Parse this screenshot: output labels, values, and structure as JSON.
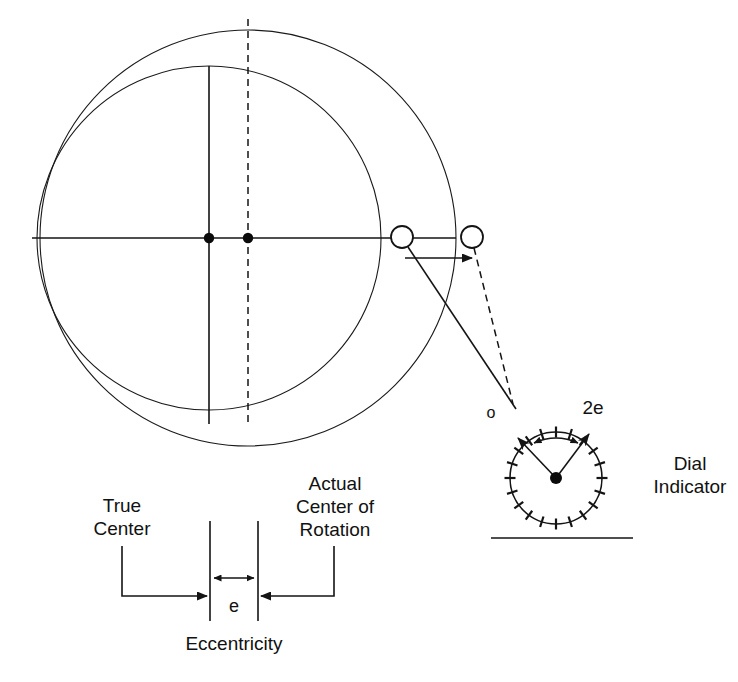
{
  "figure": {
    "type": "technical-line-diagram",
    "background_color": "#ffffff",
    "line_color": "#141414"
  },
  "labels": {
    "true_center": "True\nCenter",
    "actual_center": "Actual\nCenter of\nRotation",
    "eccentricity": "Eccentricity",
    "eccentricity_symbol": "e",
    "dial_indicator": "Dial\nIndicator",
    "dial_zero": "o",
    "dial_two_e": "2e"
  },
  "geometry": {
    "true_circle": {
      "cx": 209,
      "cy": 238,
      "r": 172,
      "role": "true-part-outline"
    },
    "rotation_circle": {
      "cx": 248,
      "cy": 238,
      "r": 208,
      "role": "swept-path-outline"
    },
    "true_center_dot": {
      "cx": 209,
      "cy": 238,
      "r": 5
    },
    "rotation_center_dot": {
      "cx": 248,
      "cy": 238,
      "r": 5
    },
    "horizontal_axis": {
      "x1": 32,
      "y1": 238,
      "x2": 456,
      "y2": 238
    },
    "vertical_solid_axis": {
      "x": 209,
      "y1": 66,
      "x2": 209,
      "y2": 424
    },
    "vertical_dashed_axis": {
      "x": 248,
      "y1": 19,
      "y2": 424
    },
    "probe_circle_near": {
      "cx": 402,
      "cy": 237,
      "r": 11
    },
    "probe_circle_far": {
      "cx": 472,
      "cy": 237,
      "r": 11
    },
    "displacement_arrow": {
      "x1": 405,
      "y1": 258,
      "x2": 474,
      "y2": 258
    },
    "dial": {
      "cx": 556,
      "cy": 478,
      "r": 46,
      "tick_count": 20
    },
    "dial_baseline": {
      "x1": 491,
      "y1": 538,
      "x2": 633,
      "y2": 538
    },
    "dial_hub": {
      "cx": 556,
      "cy": 478,
      "r": 6
    },
    "needle_left_angle_deg": -131,
    "needle_right_angle_deg": -53,
    "ecc_line_left_x": 210,
    "ecc_line_right_x": 258,
    "ecc_line_top_y": 521,
    "ecc_line_bottom_y": 621
  },
  "annotations": {
    "measure_label": "e",
    "swing_label": "2e",
    "zero_label": "o"
  }
}
